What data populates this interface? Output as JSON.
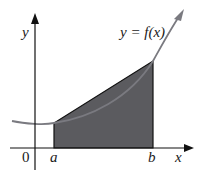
{
  "diagram": {
    "function_label": "y = f(x)",
    "axis_labels": {
      "x": "x",
      "y": "y"
    },
    "origin_label": "0",
    "tick_labels": {
      "a": "a",
      "b": "b"
    },
    "colors": {
      "axis": "#111111",
      "curve": "#7a7a80",
      "shaded_region": "#5b5b5f",
      "region_edge": "#111111"
    }
  }
}
